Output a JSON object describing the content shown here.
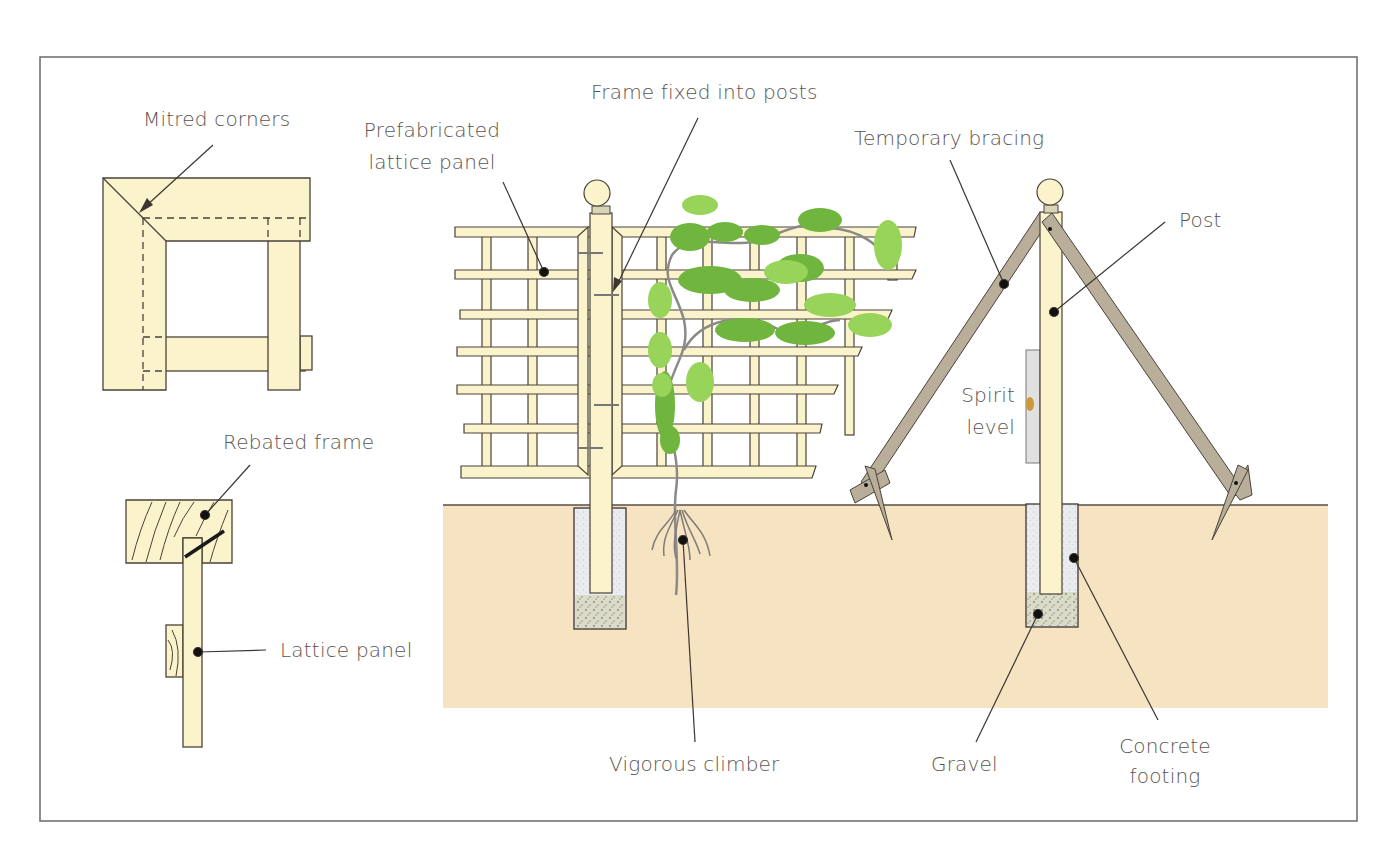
{
  "diagram": {
    "colors": {
      "wood": "#fbf3cc",
      "wood_stroke": "#4a4238",
      "ground": "#f6e3c2",
      "bracing": "#b9ae99",
      "leaf_dark": "#6fb53e",
      "leaf_light": "#98d35a",
      "stem": "#8c8a86",
      "concrete": "#e8e9ec",
      "gravel": "#d9dbc8",
      "spirit_level": "#e0e0e0",
      "bubble": "#c99a3a",
      "label_text": "#5a5450",
      "leader": "#3c3530",
      "frame": "#6a6a6a"
    },
    "labels": {
      "mitred_corners": "Mitred corners",
      "rebated_frame": "Rebated frame",
      "lattice_panel": "Lattice panel",
      "prefab_line1": "Prefabricated",
      "prefab_line2": "lattice panel",
      "frame_fixed": "Frame fixed into posts",
      "temporary_bracing": "Temporary bracing",
      "post": "Post",
      "spirit_line1": "Spirit",
      "spirit_line2": "level",
      "vigorous_climber": "Vigorous climber",
      "gravel": "Gravel",
      "concrete_line1": "Concrete",
      "concrete_line2": "footing"
    }
  }
}
